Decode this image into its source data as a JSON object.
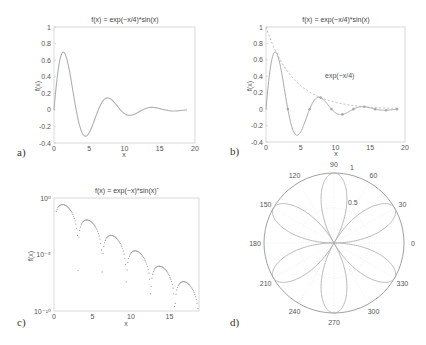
{
  "chart_data": [
    {
      "panel": "a)",
      "type": "line",
      "title": "f(x) = exp(−x/4)*sin(x)",
      "xlabel": "x",
      "ylabel": "f(x)",
      "xlim": [
        0,
        20
      ],
      "ylim": [
        -0.4,
        1
      ],
      "xticks": [
        0,
        5,
        10,
        15,
        20
      ],
      "yticks": [
        -0.4,
        -0.2,
        0,
        0.2,
        0.4,
        0.6,
        0.8,
        1
      ],
      "ytick_labels": [
        "-0.4",
        "-0.2",
        "0",
        "0.2",
        "0.4",
        "0.6",
        "0.8",
        "1"
      ],
      "grid": false,
      "series": [
        {
          "name": "exp(-x/4)*sin(x)",
          "function": "exp(-x/4)*sin(x)",
          "x_range": [
            0,
            18.85
          ],
          "style": "solid",
          "color": "#b0b0b0"
        }
      ]
    },
    {
      "panel": "b)",
      "type": "line",
      "title": "f(x) = exp(−x/4)*sin(x)",
      "xlabel": "x",
      "ylabel": "f(x)",
      "xlim": [
        0,
        20
      ],
      "ylim": [
        -0.4,
        1
      ],
      "xticks": [
        0,
        5,
        10,
        15,
        20
      ],
      "yticks": [
        -0.4,
        -0.2,
        0,
        0.2,
        0.4,
        0.6,
        0.8,
        1
      ],
      "ytick_labels": [
        "-0.4",
        "-0.2",
        "0",
        "0.2",
        "0.4",
        "0.6",
        "0.8",
        "1"
      ],
      "annotation": {
        "text": "exp(−x/4)",
        "x": 8.5,
        "y": 0.38
      },
      "series": [
        {
          "name": "exp(-x/4)*sin(x)",
          "function": "exp(-x/4)*sin(x)",
          "x_range": [
            0,
            18.85
          ],
          "style": "solid",
          "color": "#a8a8a8"
        },
        {
          "name": "exp(-x/4)",
          "function": "exp(-x/4)",
          "x_range": [
            0,
            18.85
          ],
          "style": "dashed",
          "color": "#b5b5b5"
        },
        {
          "name": "markers",
          "style": "markers",
          "color": "#999999",
          "x": [
            3.14,
            6.28,
            7.85,
            9.42,
            10.99,
            12.57,
            14.14,
            15.71,
            17.28,
            18.85
          ]
        }
      ]
    },
    {
      "panel": "c)",
      "type": "scatter",
      "title": "f(x) = exp(−x)*sin(x)²",
      "xlabel": "x",
      "ylabel": "f(x)",
      "yscale": "log",
      "xlim": [
        0,
        18.85
      ],
      "ylim": [
        1e-10,
        1
      ],
      "xticks": [
        0,
        5,
        10,
        15
      ],
      "yticks": [
        1,
        1e-05,
        1e-10
      ],
      "ytick_labels": [
        "10⁰",
        "10⁻⁵",
        "10⁻¹⁰"
      ],
      "series": [
        {
          "name": "exp(-x)*sin(x)^2",
          "function": "exp(-x)*sin(x)^2",
          "x_range": [
            0.3,
            18.8
          ],
          "n_points": 190,
          "style": "dots",
          "color": "#999999"
        }
      ]
    },
    {
      "panel": "d)",
      "type": "polar",
      "function": "r = |sin(3θ)|",
      "rlim": [
        0,
        1
      ],
      "rticks": [
        0.5,
        1
      ],
      "rtick_labels": [
        "0.5",
        "1"
      ],
      "angle_ticks": [
        0,
        30,
        60,
        90,
        120,
        150,
        180,
        210,
        240,
        270,
        300,
        330
      ],
      "petal_directions_deg": [
        30,
        90,
        150,
        210,
        270,
        330
      ],
      "color": "#b0b0b0"
    }
  ],
  "labels": {
    "a": "a)",
    "b": "b)",
    "c": "c)",
    "d": "d)",
    "x": "x",
    "fx": "f(x)",
    "title_ab": "f(x) = exp(−x/4)*sin(x)",
    "title_c": "f(x) = exp(−x)*sin(x)ˆ",
    "annot_b": "exp(−x/4)"
  }
}
